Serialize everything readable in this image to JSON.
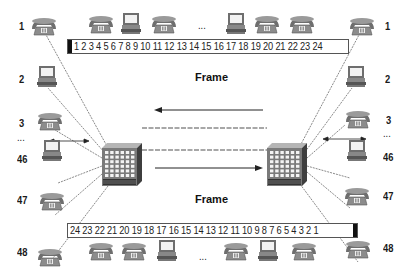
{
  "diagram": {
    "type": "TDM multiplexed link between two multiplexers",
    "frame_label_top": "Frame",
    "frame_label_bottom": "Frame",
    "top_frame_slots": "1 2 3 4 5 6 7 8 9 10 11 12 13 14 15 16 17 18 19 20 21 22 23 24",
    "bottom_frame_slots": "24 23 22 21 20 19 18 17 16 15 14 13 12 11 10 9 8 7 6 5 4 3 2 1",
    "ellipsis": "...",
    "left_endpoints": [
      {
        "label": "1",
        "device": "telephone"
      },
      {
        "label": "2",
        "device": "computer"
      },
      {
        "label": "3",
        "device": "telephone"
      },
      {
        "label": "...",
        "device": "none"
      },
      {
        "label": "46",
        "device": "computer"
      },
      {
        "label": "47",
        "device": "telephone"
      },
      {
        "label": "48",
        "device": "telephone"
      }
    ],
    "right_endpoints": [
      {
        "label": "1",
        "device": "telephone"
      },
      {
        "label": "2",
        "device": "computer"
      },
      {
        "label": "3",
        "device": "telephone"
      },
      {
        "label": "...",
        "device": "none"
      },
      {
        "label": "46",
        "device": "computer"
      },
      {
        "label": "47",
        "device": "telephone"
      },
      {
        "label": "48",
        "device": "telephone"
      }
    ],
    "top_row_devices": [
      "telephone",
      "computer",
      "telephone",
      "...",
      "computer",
      "telephone",
      "telephone"
    ],
    "bottom_row_devices": [
      "telephone",
      "telephone",
      "computer",
      "...",
      "telephone",
      "computer",
      "telephone"
    ],
    "top_arrow_direction": "left",
    "bottom_arrow_direction": "right",
    "colors": {
      "line": "#8a8a8a",
      "switch_face": "#7a7a7a",
      "switch_top": "#b5b5b5",
      "switch_side": "#3e3e3e",
      "device": "#6e6e6e"
    }
  }
}
